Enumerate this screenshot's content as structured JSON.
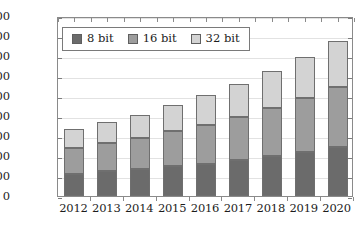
{
  "chart_data": {
    "type": "bar",
    "stacked": true,
    "title": "",
    "subtitle": "",
    "xlabel": "",
    "ylabel": "",
    "grid": true,
    "legend_position": "top-left",
    "categories": [
      "2012",
      "2013",
      "2014",
      "2015",
      "2016",
      "2017",
      "2018",
      "2019",
      "2020"
    ],
    "ylim": [
      0,
      9000
    ],
    "ytick_values": [
      0,
      1000,
      2000,
      3000,
      4000,
      5000,
      6000,
      7000,
      8000,
      9000
    ],
    "ytick_labels": [
      "0",
      "1,000",
      "2,000",
      "3,000",
      "4,000",
      "5,000",
      "6,000",
      "7,000",
      "8,000",
      "9,000"
    ],
    "series": [
      {
        "name": "8 bit",
        "color": "#6b6b6b",
        "values": [
          1100,
          1250,
          1350,
          1500,
          1600,
          1800,
          2000,
          2200,
          2450
        ]
      },
      {
        "name": "16 bit",
        "color": "#9d9d9d",
        "values": [
          1300,
          1400,
          1550,
          1750,
          1950,
          2150,
          2400,
          2700,
          3000
        ]
      },
      {
        "name": "32 bit",
        "color": "#d3d3d3",
        "values": [
          950,
          1050,
          1150,
          1300,
          1500,
          1650,
          1850,
          2050,
          2300
        ]
      }
    ],
    "totals": [
      3350,
      3700,
      4050,
      4550,
      5050,
      5600,
      6250,
      6950,
      7750
    ]
  },
  "legend": {
    "items": [
      {
        "label": "8 bit",
        "color": "#6b6b6b"
      },
      {
        "label": "16 bit",
        "color": "#9d9d9d"
      },
      {
        "label": "32 bit",
        "color": "#d3d3d3"
      }
    ]
  },
  "colors": {
    "axis": "#8a8a8a",
    "grid": "#e2e2e2",
    "text": "#1c1c1c",
    "background": "#ffffff"
  }
}
